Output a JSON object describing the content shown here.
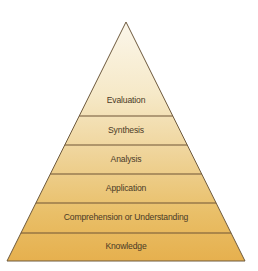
{
  "diagram": {
    "type": "pyramid",
    "title": "",
    "apex": [
      126,
      22
    ],
    "base_y": 261,
    "base_left_x": 7,
    "base_right_x": 245,
    "colors": {
      "top": "#faf3e2",
      "bottom": "#e6b04e",
      "outline": "#6e5a3e",
      "divider": "#6e5436",
      "text": "#4a3a26"
    },
    "layers": [
      {
        "label": "Evaluation",
        "top_y": 22,
        "bottom_y": 116
      },
      {
        "label": "Synthesis",
        "top_y": 116,
        "bottom_y": 145
      },
      {
        "label": "Analysis",
        "top_y": 145,
        "bottom_y": 174
      },
      {
        "label": "Application",
        "top_y": 174,
        "bottom_y": 203
      },
      {
        "label": "Comprehension or Understanding",
        "top_y": 203,
        "bottom_y": 233
      },
      {
        "label": "Knowledge",
        "top_y": 233,
        "bottom_y": 261
      }
    ]
  }
}
